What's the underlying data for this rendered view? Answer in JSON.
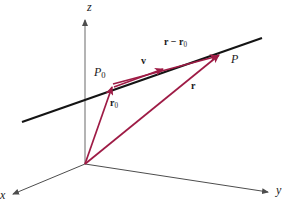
{
  "figure": {
    "background_color": "#ffffff",
    "width": 291,
    "height": 203,
    "colors": {
      "vector": "#9e1b45",
      "line": "#141414",
      "axis": "#4d4d4d",
      "text": "#1a1a1a"
    }
  },
  "axes": [
    {
      "name": "z-axis",
      "label": "z",
      "direction": "up",
      "label_x": 89,
      "label_y": 2
    },
    {
      "name": "y-axis",
      "label": "y",
      "direction": "right-down",
      "label_x": 277,
      "label_y": 186
    },
    {
      "name": "x-axis",
      "label": "x",
      "direction": "left-down",
      "label_x": 1,
      "label_y": 190
    }
  ],
  "points": [
    {
      "name": "origin",
      "label": "",
      "x": 85,
      "y": 164
    },
    {
      "name": "point-P0",
      "label": "P",
      "subscript": "0",
      "x": 113,
      "y": 84,
      "label_x": 95,
      "label_y": 68
    },
    {
      "name": "point-P",
      "label": "P",
      "subscript": "",
      "x": 222,
      "y": 52,
      "label_x": 232,
      "label_y": 54
    }
  ],
  "vectors": [
    {
      "name": "vector-r0",
      "label": "r",
      "subscript": "0",
      "from": "origin",
      "to": "point-P0",
      "label_x": 113,
      "label_y": 99
    },
    {
      "name": "vector-r",
      "label": "r",
      "subscript": "",
      "from": "origin",
      "to": "point-P",
      "label_x": 192,
      "label_y": 82
    },
    {
      "name": "vector-v",
      "label": "v",
      "subscript": "",
      "from": "point-P0",
      "to": "direction-along-line",
      "label_x": 143,
      "label_y": 58
    },
    {
      "name": "vector-r-minus-r0",
      "label": "r − r",
      "subscript": "0",
      "from": "point-P0",
      "to": "point-P",
      "label_x": 167,
      "label_y": 39
    }
  ],
  "line": {
    "name": "line-through-P0-and-P",
    "start_x": 22,
    "start_y": 122,
    "end_x": 262,
    "end_y": 38
  }
}
